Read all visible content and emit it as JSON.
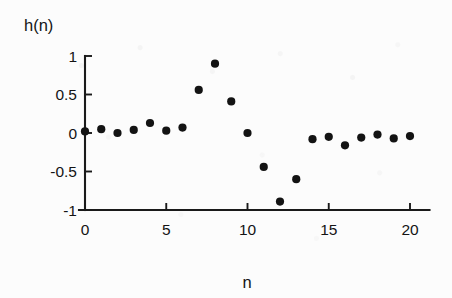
{
  "chart_data": {
    "type": "scatter",
    "title": "",
    "xlabel": "n",
    "ylabel": "h(n)",
    "xlim": [
      -0.6,
      21.2
    ],
    "ylim": [
      -1.0,
      1.0
    ],
    "xticks": [
      0,
      5,
      10,
      15,
      20
    ],
    "xtick_labels": [
      "0",
      "5",
      "10",
      "15",
      "20"
    ],
    "yticks": [
      -1,
      -0.5,
      0,
      0.5,
      1
    ],
    "ytick_labels": [
      "-1",
      "-0.5",
      "0",
      "0.5",
      "1"
    ],
    "grid": false,
    "legend": false,
    "marker": "filled-circle",
    "marker_color": "#131313",
    "axis_color": "#1a1a1a",
    "background_color": "#fcfcfc",
    "x": [
      0,
      1,
      2,
      3,
      4,
      5,
      6,
      7,
      8,
      9,
      10,
      11,
      12,
      13,
      14,
      15,
      16,
      17,
      18,
      19,
      20
    ],
    "values": [
      0.02,
      0.05,
      0.0,
      0.04,
      0.13,
      0.03,
      0.07,
      0.56,
      0.9,
      0.41,
      0.0,
      -0.44,
      -0.89,
      -0.6,
      -0.08,
      -0.05,
      -0.16,
      -0.06,
      -0.02,
      -0.07,
      -0.04
    ],
    "series": [
      {
        "name": "h(n)",
        "values": [
          0.02,
          0.05,
          0.0,
          0.04,
          0.13,
          0.03,
          0.07,
          0.56,
          0.9,
          0.41,
          0.0,
          -0.44,
          -0.89,
          -0.6,
          -0.08,
          -0.05,
          -0.16,
          -0.06,
          -0.02,
          -0.07,
          -0.04
        ]
      }
    ]
  }
}
